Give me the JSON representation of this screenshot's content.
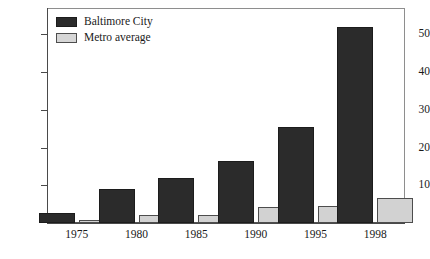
{
  "chart_data": {
    "type": "bar",
    "title": "",
    "subtitle": "",
    "xlabel": "",
    "ylabel": "",
    "categories": [
      "1975",
      "1980",
      "1985",
      "1990",
      "1995",
      "1998"
    ],
    "series": [
      {
        "name": "Baltimore City",
        "color": "#2b2b2b",
        "values": [
          2.6,
          9.0,
          12.0,
          16.5,
          25.5,
          52.0
        ]
      },
      {
        "name": "Metro average",
        "color": "#d2d2d2",
        "values": [
          0.8,
          2.0,
          2.2,
          4.3,
          4.6,
          6.5
        ]
      }
    ],
    "ylim": [
      0,
      57
    ],
    "yticks": [
      10,
      20,
      30,
      40,
      50
    ],
    "ytick_labels": [
      "10",
      "20",
      "30",
      "40",
      "50"
    ],
    "grid": false,
    "legend_position": "top-left",
    "annotations": []
  },
  "legend": {
    "items": [
      {
        "label": "Baltimore City",
        "swatch": "dark-swatch"
      },
      {
        "label": "Metro average",
        "swatch": "light-swatch"
      }
    ]
  }
}
